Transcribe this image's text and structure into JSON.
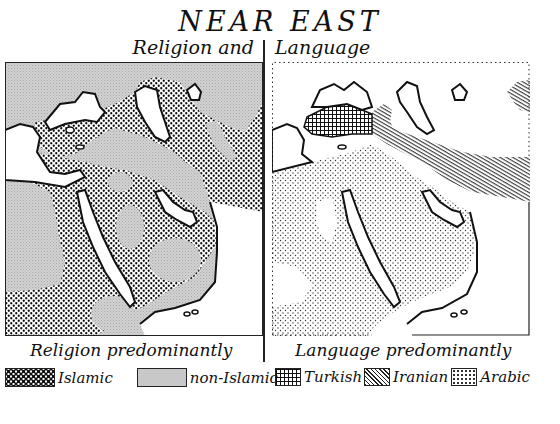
{
  "title": "NEAR EAST",
  "subtitle": {
    "left": "Religion and",
    "right": "Language"
  },
  "maps": {
    "religion": {
      "legend_title": "Religion predominantly",
      "legend": [
        {
          "label": "Islamic",
          "pattern": "dense-checker-dots",
          "color": "#111111"
        },
        {
          "label": "non-Islamic",
          "pattern": "light-gray-stipple",
          "color": "#c4c4c4"
        }
      ]
    },
    "language": {
      "legend_title": "Language predominantly",
      "legend": [
        {
          "label": "Turkish",
          "pattern": "crosshatch-grid",
          "color": "#111111"
        },
        {
          "label": "Iranian",
          "pattern": "diagonal-lines",
          "color": "#111111"
        },
        {
          "label": "Arabic",
          "pattern": "sparse-dots",
          "color": "#333333"
        }
      ]
    }
  },
  "colors": {
    "ink": "#111111",
    "paper": "#ffffff",
    "gray_fill": "#c8c8c8"
  }
}
